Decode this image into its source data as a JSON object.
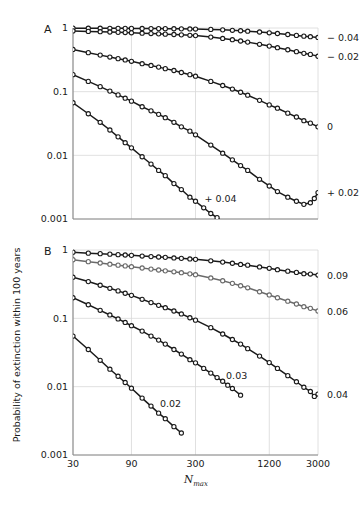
{
  "figure": {
    "y_axis_title": "Probability of extinction within 100 years",
    "x_axis_title_main": "N",
    "x_axis_title_sub": "max"
  },
  "chart_data": {
    "type": "line",
    "title": "",
    "xlabel": "N_max",
    "ylabel": "Probability of extinction within 100 years",
    "xscale": "log",
    "yscale": "log",
    "xlim": [
      30,
      3000
    ],
    "ylim": [
      0.001,
      1
    ],
    "grid": true,
    "legend_position": "right-of-axes-and-inline",
    "x_ticks": [
      30,
      90,
      300,
      1200,
      3000
    ],
    "x_tick_labels": [
      "30",
      "90",
      "300",
      "1200",
      "3000"
    ],
    "y_ticks": [
      1,
      0.1,
      0.01,
      0.001
    ],
    "y_tick_labels": [
      "1",
      "0.1",
      "0.01",
      "0.001"
    ],
    "panels": [
      {
        "letter": "A",
        "series": [
          {
            "name": "-0.04",
            "label": "− 0.04",
            "label_position": "right",
            "color": "#1a1a1a",
            "x": [
              30,
              40,
              50,
              60,
              70,
              80,
              90,
              110,
              130,
              150,
              170,
              200,
              230,
              270,
              300,
              400,
              500,
              600,
              700,
              800,
              1000,
              1200,
              1400,
              1700,
              2000,
              2300,
              2600,
              3000
            ],
            "y": [
              0.995,
              0.993,
              0.991,
              0.99,
              0.988,
              0.987,
              0.985,
              0.982,
              0.98,
              0.978,
              0.976,
              0.973,
              0.97,
              0.966,
              0.963,
              0.95,
              0.935,
              0.92,
              0.905,
              0.89,
              0.865,
              0.84,
              0.82,
              0.79,
              0.765,
              0.745,
              0.73,
              0.71
            ]
          },
          {
            "name": "-0.02",
            "label": "− 0.02",
            "label_position": "right",
            "color": "#1a1a1a",
            "x": [
              30,
              40,
              50,
              60,
              70,
              80,
              90,
              110,
              130,
              150,
              170,
              200,
              230,
              270,
              300,
              400,
              500,
              600,
              700,
              800,
              1000,
              1200,
              1400,
              1700,
              2000,
              2300,
              2600,
              3000
            ],
            "y": [
              0.9,
              0.885,
              0.875,
              0.865,
              0.855,
              0.848,
              0.84,
              0.828,
              0.818,
              0.81,
              0.8,
              0.79,
              0.78,
              0.768,
              0.76,
              0.72,
              0.685,
              0.655,
              0.625,
              0.6,
              0.555,
              0.52,
              0.49,
              0.455,
              0.425,
              0.4,
              0.385,
              0.36
            ]
          },
          {
            "name": "0",
            "label": "0",
            "label_position": "right",
            "color": "#1a1a1a",
            "x": [
              30,
              40,
              50,
              60,
              70,
              80,
              90,
              110,
              130,
              150,
              170,
              200,
              230,
              270,
              300,
              400,
              500,
              600,
              700,
              800,
              1000,
              1200,
              1400,
              1700,
              2000,
              2300,
              2600,
              3000
            ],
            "y": [
              0.46,
              0.41,
              0.375,
              0.35,
              0.33,
              0.315,
              0.3,
              0.275,
              0.258,
              0.243,
              0.23,
              0.215,
              0.2,
              0.185,
              0.175,
              0.145,
              0.125,
              0.11,
              0.098,
              0.088,
              0.073,
              0.062,
              0.055,
              0.046,
              0.04,
              0.035,
              0.032,
              0.028
            ]
          },
          {
            "name": "+0.02",
            "label": "+ 0.02",
            "label_position": "right",
            "color": "#1a1a1a",
            "x": [
              30,
              40,
              50,
              60,
              70,
              80,
              90,
              110,
              130,
              150,
              170,
              200,
              230,
              270,
              300,
              400,
              500,
              600,
              700,
              800,
              1000,
              1200,
              1400,
              1700,
              2000,
              2300,
              2600,
              2800,
              3000
            ],
            "y": [
              0.185,
              0.145,
              0.12,
              0.102,
              0.089,
              0.079,
              0.071,
              0.058,
              0.05,
              0.044,
              0.039,
              0.033,
              0.028,
              0.024,
              0.021,
              0.0145,
              0.0108,
              0.0085,
              0.0069,
              0.0058,
              0.0042,
              0.0033,
              0.0027,
              0.0022,
              0.0019,
              0.0017,
              0.0018,
              0.0021,
              0.0026
            ]
          },
          {
            "name": "+0.04",
            "label": "+ 0.04",
            "label_position": "inline",
            "color": "#1a1a1a",
            "x": [
              30,
              40,
              50,
              60,
              70,
              80,
              90,
              110,
              130,
              150,
              170,
              200,
              230,
              270,
              300,
              350,
              400,
              450,
              500
            ],
            "y": [
              0.067,
              0.045,
              0.033,
              0.025,
              0.0195,
              0.0158,
              0.0131,
              0.0095,
              0.0073,
              0.0058,
              0.0048,
              0.0036,
              0.0029,
              0.0022,
              0.0019,
              0.0015,
              0.00122,
              0.00105,
              0.0009
            ]
          }
        ]
      },
      {
        "letter": "B",
        "series": [
          {
            "name": "0.09",
            "label": "0.09",
            "label_position": "right",
            "color": "#1a1a1a",
            "x": [
              30,
              40,
              50,
              60,
              70,
              80,
              90,
              110,
              130,
              150,
              170,
              200,
              230,
              270,
              300,
              400,
              500,
              600,
              700,
              800,
              1000,
              1200,
              1400,
              1700,
              2000,
              2300,
              2600,
              3000
            ],
            "y": [
              0.93,
              0.9,
              0.885,
              0.87,
              0.855,
              0.845,
              0.835,
              0.815,
              0.8,
              0.79,
              0.78,
              0.765,
              0.755,
              0.74,
              0.73,
              0.695,
              0.665,
              0.64,
              0.615,
              0.6,
              0.565,
              0.54,
              0.515,
              0.49,
              0.47,
              0.45,
              0.445,
              0.43
            ]
          },
          {
            "name": "0.06",
            "label": "0.06",
            "label_position": "right",
            "color": "#6a6a6a",
            "x": [
              30,
              40,
              50,
              60,
              70,
              80,
              90,
              110,
              130,
              150,
              170,
              200,
              230,
              270,
              300,
              400,
              500,
              600,
              700,
              800,
              1000,
              1200,
              1400,
              1700,
              2000,
              2300,
              2600,
              3000
            ],
            "y": [
              0.72,
              0.675,
              0.645,
              0.62,
              0.6,
              0.585,
              0.57,
              0.545,
              0.525,
              0.51,
              0.495,
              0.48,
              0.465,
              0.448,
              0.435,
              0.39,
              0.355,
              0.325,
              0.3,
              0.28,
              0.245,
              0.22,
              0.2,
              0.178,
              0.162,
              0.148,
              0.14,
              0.128
            ]
          },
          {
            "name": "0.04",
            "label": "0.04",
            "label_position": "right",
            "color": "#1a1a1a",
            "x": [
              30,
              40,
              50,
              60,
              70,
              80,
              90,
              110,
              130,
              150,
              170,
              200,
              230,
              270,
              300,
              400,
              500,
              600,
              700,
              800,
              1000,
              1200,
              1400,
              1700,
              2000,
              2300,
              2600,
              2800,
              3000
            ],
            "y": [
              0.4,
              0.345,
              0.305,
              0.275,
              0.252,
              0.233,
              0.217,
              0.19,
              0.17,
              0.155,
              0.143,
              0.128,
              0.116,
              0.102,
              0.094,
              0.073,
              0.059,
              0.049,
              0.042,
              0.036,
              0.028,
              0.0225,
              0.0185,
              0.0145,
              0.0118,
              0.0098,
              0.0085,
              0.0072,
              0.0078
            ]
          },
          {
            "name": "0.03",
            "label": "0.03",
            "label_position": "inline",
            "color": "#1a1a1a",
            "x": [
              30,
              40,
              50,
              60,
              70,
              80,
              90,
              110,
              130,
              150,
              170,
              200,
              230,
              270,
              300,
              350,
              400,
              450,
              500,
              550,
              600,
              700
            ],
            "y": [
              0.2,
              0.158,
              0.131,
              0.112,
              0.098,
              0.087,
              0.078,
              0.065,
              0.055,
              0.048,
              0.042,
              0.035,
              0.03,
              0.0248,
              0.0223,
              0.0185,
              0.0158,
              0.0136,
              0.012,
              0.0105,
              0.0094,
              0.0075
            ]
          },
          {
            "name": "0.02",
            "label": "0.02",
            "label_position": "inline",
            "color": "#1a1a1a",
            "x": [
              30,
              40,
              50,
              60,
              70,
              80,
              90,
              110,
              130,
              150,
              170,
              200,
              230
            ],
            "y": [
              0.055,
              0.035,
              0.0243,
              0.018,
              0.0142,
              0.0115,
              0.0095,
              0.0068,
              0.0052,
              0.0041,
              0.0034,
              0.0026,
              0.0021
            ]
          }
        ]
      }
    ]
  }
}
